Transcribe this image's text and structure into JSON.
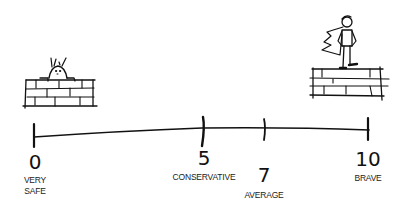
{
  "scale": {
    "ticks": [
      {
        "value": "0",
        "label_lines": [
          "VERY",
          "SAFE"
        ]
      },
      {
        "value": "5",
        "label_lines": [
          "CONSERVATIVE"
        ]
      },
      {
        "value": "7",
        "label_lines": [
          "AVERAGE"
        ]
      },
      {
        "value": "10",
        "label_lines": [
          "BRAVE"
        ]
      }
    ]
  },
  "figures": {
    "left": "person-hiding-behind-wall",
    "right": "caped-hero-standing-on-wall"
  },
  "colors": {
    "ink": "#111111",
    "background": "#ffffff"
  }
}
